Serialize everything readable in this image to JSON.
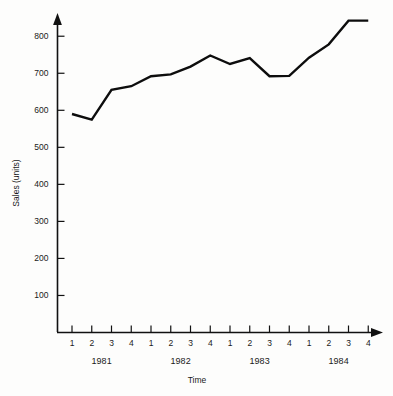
{
  "chart_data": {
    "type": "line",
    "title": "",
    "subtitle": "",
    "xlabel": "Time",
    "ylabel": "Sales (units)",
    "grid": false,
    "legend": false,
    "legend_position": "none",
    "xlim": [
      0,
      17
    ],
    "ylim": [
      0,
      860
    ],
    "y_ticks": [
      100,
      200,
      300,
      400,
      500,
      600,
      700,
      800
    ],
    "y_tick_labels": [
      "100",
      "200",
      "300",
      "400",
      "500",
      "600",
      "700",
      "800"
    ],
    "x_tick_labels": [
      "1",
      "2",
      "3",
      "4",
      "1",
      "2",
      "3",
      "4",
      "1",
      "2",
      "3",
      "4",
      "1",
      "2",
      "3",
      "4"
    ],
    "group_labels": [
      "1981",
      "1982",
      "1983",
      "1984"
    ],
    "categories": [
      "1981 Q1",
      "1981 Q2",
      "1981 Q3",
      "1981 Q4",
      "1982 Q1",
      "1982 Q2",
      "1982 Q3",
      "1982 Q4",
      "1983 Q1",
      "1983 Q2",
      "1983 Q3",
      "1983 Q4",
      "1984 Q1",
      "1984 Q2",
      "1984 Q3",
      "1984 Q4"
    ],
    "values": [
      590,
      575,
      655,
      665,
      692,
      697,
      718,
      748,
      725,
      741,
      692,
      693,
      742,
      778,
      842,
      842
    ],
    "series": [
      {
        "name": "Sales",
        "color": "#0d0d0d",
        "values": [
          590,
          575,
          655,
          665,
          692,
          697,
          718,
          748,
          725,
          741,
          692,
          693,
          742,
          778,
          842,
          842
        ]
      }
    ]
  },
  "colors": {
    "background": "#fdfdfc",
    "axis": "#111111",
    "line": "#0d0d0d",
    "text": "#1a1a1a"
  }
}
